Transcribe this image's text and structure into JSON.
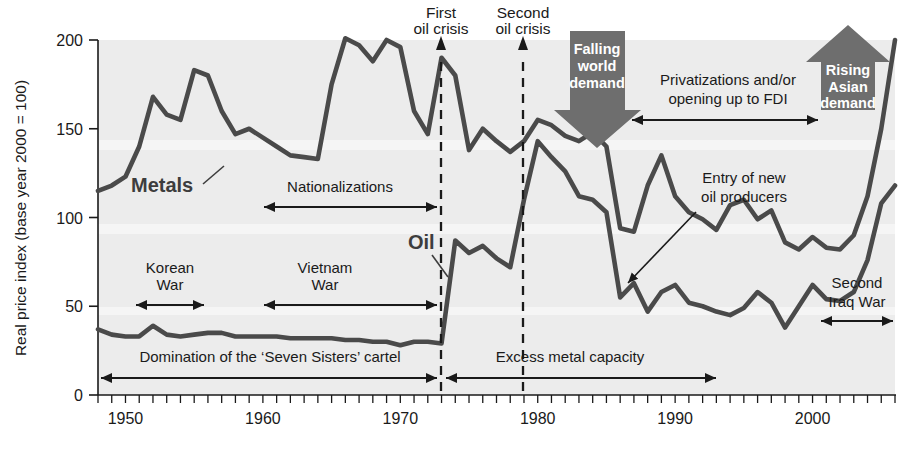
{
  "chart_data": {
    "type": "line",
    "title": "",
    "xlabel": "",
    "ylabel": "Real price index (base year 2000 = 100)",
    "xlim": [
      1948,
      2006
    ],
    "ylim": [
      0,
      200
    ],
    "grid": false,
    "legend_position": "inline-labels",
    "y_ticks": [
      "0",
      "50",
      "100",
      "150",
      "200"
    ],
    "y_tick_values": [
      0,
      50,
      100,
      150,
      200
    ],
    "x_ticks": [
      "1950",
      "1960",
      "1970",
      "1980",
      "1990",
      "2000"
    ],
    "x_tick_values": [
      1950,
      1960,
      1970,
      1980,
      1990,
      2000
    ],
    "x_minor_tick_step": 1,
    "series": [
      {
        "name": "Metals",
        "color": "#4a4a4a",
        "x": [
          1948,
          1949,
          1950,
          1951,
          1952,
          1953,
          1954,
          1955,
          1956,
          1957,
          1958,
          1959,
          1960,
          1961,
          1962,
          1963,
          1964,
          1965,
          1966,
          1967,
          1968,
          1969,
          1970,
          1971,
          1972,
          1973,
          1974,
          1975,
          1976,
          1977,
          1978,
          1979,
          1980,
          1981,
          1982,
          1983,
          1984,
          1985,
          1986,
          1987,
          1988,
          1989,
          1990,
          1991,
          1992,
          1993,
          1994,
          1995,
          1996,
          1997,
          1998,
          1999,
          2000,
          2001,
          2002,
          2003,
          2004,
          2005,
          2006
        ],
        "values": [
          115,
          118,
          123,
          140,
          168,
          158,
          155,
          183,
          180,
          160,
          147,
          150,
          145,
          140,
          135,
          134,
          133,
          175,
          201,
          197,
          188,
          200,
          196,
          160,
          147,
          190,
          180,
          138,
          150,
          143,
          137,
          143,
          155,
          152,
          146,
          143,
          148,
          140,
          94,
          92,
          118,
          135,
          112,
          103,
          99,
          93,
          107,
          110,
          99,
          104,
          86,
          82,
          89,
          83,
          82,
          90,
          112,
          150,
          200
        ]
      },
      {
        "name": "Oil",
        "color": "#4a4a4a",
        "x": [
          1948,
          1949,
          1950,
          1951,
          1952,
          1953,
          1954,
          1955,
          1956,
          1957,
          1958,
          1959,
          1960,
          1961,
          1962,
          1963,
          1964,
          1965,
          1966,
          1967,
          1968,
          1969,
          1970,
          1971,
          1972,
          1973,
          1974,
          1975,
          1976,
          1977,
          1978,
          1979,
          1980,
          1981,
          1982,
          1983,
          1984,
          1985,
          1986,
          1987,
          1988,
          1989,
          1990,
          1991,
          1992,
          1993,
          1994,
          1995,
          1996,
          1997,
          1998,
          1999,
          2000,
          2001,
          2002,
          2003,
          2004,
          2005,
          2006
        ],
        "values": [
          37,
          34,
          33,
          33,
          39,
          34,
          33,
          34,
          35,
          35,
          33,
          33,
          33,
          33,
          32,
          32,
          32,
          32,
          31,
          31,
          30,
          30,
          28,
          30,
          30,
          29,
          87,
          80,
          84,
          77,
          72,
          110,
          143,
          134,
          126,
          112,
          110,
          103,
          55,
          63,
          47,
          58,
          62,
          52,
          50,
          47,
          45,
          49,
          58,
          52,
          38,
          50,
          62,
          54,
          53,
          58,
          76,
          108,
          118
        ]
      }
    ],
    "annotations": [
      {
        "id": "metals-label",
        "text": "Metals",
        "type": "series-label"
      },
      {
        "id": "oil-label",
        "text": "Oil",
        "type": "series-label"
      },
      {
        "id": "first-oil-crisis",
        "text": "First\noil crisis",
        "type": "event-marker",
        "year": 1973
      },
      {
        "id": "second-oil-crisis",
        "text": "Second\noil crisis",
        "type": "event-marker",
        "year": 1979
      },
      {
        "id": "korean-war",
        "text": "Korean\nWar",
        "type": "span",
        "from": 1950,
        "to": 1953
      },
      {
        "id": "vietnam-war",
        "text": "Vietnam\nWar",
        "type": "span",
        "from": 1963,
        "to": 1973
      },
      {
        "id": "nationalizations",
        "text": "Nationalizations",
        "type": "span",
        "from": 1963,
        "to": 1973
      },
      {
        "id": "seven-sisters",
        "text": "Domination of the ‘Seven Sisters’ cartel",
        "type": "span",
        "from": 1948,
        "to": 1973
      },
      {
        "id": "excess-metal",
        "text": "Excess metal capacity",
        "type": "span",
        "from": 1973,
        "to": 1993
      },
      {
        "id": "privatizations",
        "text": "Privatizations and/or\nopening up to FDI",
        "type": "span",
        "from": 1986,
        "to": 1999
      },
      {
        "id": "entry-new-oil",
        "text": "Entry of new\noil producers",
        "type": "callout",
        "year": 1986
      },
      {
        "id": "second-iraq-war",
        "text": "Second\nIraq War",
        "type": "span",
        "from": 2003,
        "to": 2006
      },
      {
        "id": "falling-world-demand",
        "text": "Falling\nworld\ndemand",
        "type": "block-arrow-down"
      },
      {
        "id": "rising-asian-demand",
        "text": "Rising\nAsian\ndemand",
        "type": "block-arrow-up"
      }
    ]
  },
  "labels": {
    "y_axis_title": "Real price index (base year 2000 = 100)",
    "metals": "Metals",
    "oil": "Oil",
    "first_oil_crisis_l1": "First",
    "first_oil_crisis_l2": "oil crisis",
    "second_oil_crisis_l1": "Second",
    "second_oil_crisis_l2": "oil crisis",
    "korean_war_l1": "Korean",
    "korean_war_l2": "War",
    "vietnam_war_l1": "Vietnam",
    "vietnam_war_l2": "War",
    "nationalizations": "Nationalizations",
    "seven_sisters": "Domination of the ‘Seven Sisters’ cartel",
    "excess_metal_capacity": "Excess metal capacity",
    "privatizations_l1": "Privatizations and/or",
    "privatizations_l2": "opening up to FDI",
    "entry_new_oil_l1": "Entry of new",
    "entry_new_oil_l2": "oil producers",
    "second_iraq_war_l1": "Second",
    "second_iraq_war_l2": "Iraq War",
    "falling_demand_l1": "Falling",
    "falling_demand_l2": "world",
    "falling_demand_l3": "demand",
    "rising_demand_l1": "Rising",
    "rising_demand_l2": "Asian",
    "rising_demand_l3": "demand",
    "y0": "0",
    "y50": "50",
    "y100": "100",
    "y150": "150",
    "y200": "200",
    "x1950": "1950",
    "x1960": "1960",
    "x1970": "1970",
    "x1980": "1980",
    "x1990": "1990",
    "x2000": "2000"
  },
  "colors": {
    "line": "#4a4a4a",
    "plot_background": "#ececec",
    "band_light": "#f3f3f3",
    "block_arrow": "#6e6e6e",
    "axis": "#1a1a1a",
    "text": "#1a1a1a"
  }
}
